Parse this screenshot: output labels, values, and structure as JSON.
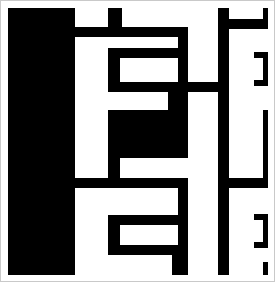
{
  "artwork": {
    "title": "Abstract Black-and-White Maze Composition",
    "medium": "geometric-shapes",
    "width": 275,
    "height": 282,
    "background_color": "#ffffff",
    "ink_color": "#000000",
    "frame_color": "#c9c9c9",
    "caption": "High-contrast abstract composition of interlocking black rectangular bars on a white field, resembling a maze or a stylized letterform."
  },
  "canvas": {
    "border_rect": {
      "x": 0.5,
      "y": 0.5,
      "width": 274,
      "height": 281
    }
  },
  "shapes": [
    {
      "name": "left-solid-block",
      "x": 8,
      "y": 8,
      "width": 67,
      "height": 267
    },
    {
      "name": "top-notch-tab",
      "x": 108,
      "y": 8,
      "width": 14,
      "height": 19
    },
    {
      "name": "upper-long-horizontal-bar",
      "x": 75,
      "y": 27,
      "width": 113,
      "height": 10
    },
    {
      "name": "upper-right-vertical-stem",
      "x": 178,
      "y": 27,
      "width": 10,
      "height": 57
    },
    {
      "name": "inner-u-left-vertical",
      "x": 108,
      "y": 48,
      "width": 12,
      "height": 44
    },
    {
      "name": "inner-u-top-horizontal",
      "x": 108,
      "y": 48,
      "width": 80,
      "height": 10
    },
    {
      "name": "inner-u-bottom-horizontal",
      "x": 108,
      "y": 82,
      "width": 112,
      "height": 10
    },
    {
      "name": "center-black-mass",
      "x": 108,
      "y": 110,
      "width": 80,
      "height": 48
    },
    {
      "name": "center-mass-right-riser",
      "x": 168,
      "y": 92,
      "width": 20,
      "height": 66
    },
    {
      "name": "center-left-descender",
      "x": 108,
      "y": 110,
      "width": 12,
      "height": 78
    },
    {
      "name": "mid-long-horizontal-bar",
      "x": 108,
      "y": 148,
      "width": 80,
      "height": 10
    },
    {
      "name": "lower-divider-horizontal",
      "x": 75,
      "y": 178,
      "width": 113,
      "height": 10
    },
    {
      "name": "bottom-right-vertical-stem",
      "x": 178,
      "y": 188,
      "width": 10,
      "height": 57
    },
    {
      "name": "bottom-u-left-vertical",
      "x": 108,
      "y": 215,
      "width": 12,
      "height": 40
    },
    {
      "name": "bottom-u-top-horizontal",
      "x": 108,
      "y": 215,
      "width": 80,
      "height": 10
    },
    {
      "name": "bottom-u-bottom-horizontal",
      "x": 108,
      "y": 245,
      "width": 80,
      "height": 10
    },
    {
      "name": "bottom-notch-tab",
      "x": 172,
      "y": 255,
      "width": 16,
      "height": 20
    },
    {
      "name": "right-tall-vertical-rail",
      "x": 218,
      "y": 8,
      "width": 11,
      "height": 267
    },
    {
      "name": "right-top-horizontal-cap",
      "x": 229,
      "y": 19,
      "width": 38,
      "height": 10
    },
    {
      "name": "right-top-edge-vertical",
      "x": 263,
      "y": 8,
      "width": 5,
      "height": 21
    },
    {
      "name": "right-upper-inset-vertical",
      "x": 263,
      "y": 52,
      "width": 5,
      "height": 34
    },
    {
      "name": "right-upper-inset-cap-top",
      "x": 254,
      "y": 52,
      "width": 14,
      "height": 6
    },
    {
      "name": "right-upper-inset-cap-bot",
      "x": 254,
      "y": 80,
      "width": 14,
      "height": 6
    },
    {
      "name": "right-mid-long-vertical",
      "x": 263,
      "y": 110,
      "width": 5,
      "height": 76
    },
    {
      "name": "right-mid-join-horizontal",
      "x": 229,
      "y": 178,
      "width": 39,
      "height": 10
    },
    {
      "name": "right-lower-inset-vertical",
      "x": 263,
      "y": 214,
      "width": 5,
      "height": 34
    },
    {
      "name": "right-lower-inset-cap-top",
      "x": 254,
      "y": 214,
      "width": 14,
      "height": 6
    },
    {
      "name": "right-lower-inset-cap-bot",
      "x": 254,
      "y": 242,
      "width": 14,
      "height": 6
    },
    {
      "name": "right-bottom-edge-vertical",
      "x": 263,
      "y": 262,
      "width": 5,
      "height": 13
    }
  ]
}
